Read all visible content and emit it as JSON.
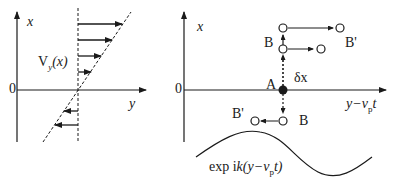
{
  "left_panel": {
    "axis_x_label": "x",
    "axis_y_label": "y",
    "origin_label": "0",
    "velocity_label_main": "V",
    "velocity_label_sub": "y",
    "velocity_label_arg": "(x)"
  },
  "right_panel": {
    "axis_x_label": "x",
    "origin_label": "0",
    "axis_h_label": "y−v",
    "axis_h_label_sub": "p",
    "axis_h_label_end": "t",
    "point_a_label": "A",
    "displacement_label": "δx",
    "point_b_upper_label": "B",
    "point_bprime_upper_label": "B'",
    "point_b_lower_label": "B",
    "point_bprime_lower_label": "B'",
    "wave_label_prefix": "exp i",
    "wave_label_k": "k",
    "wave_label_mid": "(y−v",
    "wave_label_sub": "p",
    "wave_label_end": "t)"
  },
  "colors": {
    "ink": "#1a1a1a",
    "background": "#ffffff"
  }
}
